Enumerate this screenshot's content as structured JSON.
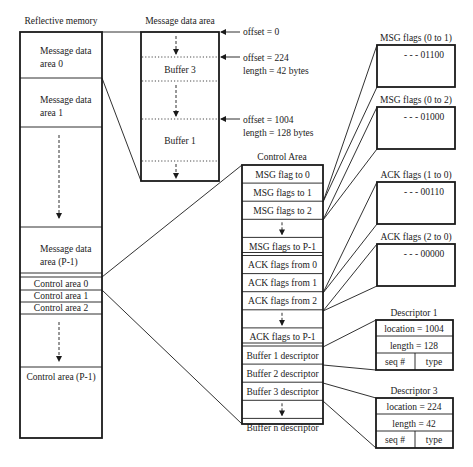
{
  "reflective_memory": {
    "title": "Reflective memory",
    "areas": [
      {
        "line1": "Message data",
        "line2": "area 0"
      },
      {
        "line1": "Message data",
        "line2": "area 1"
      },
      {
        "line1": "Message data",
        "line2": "area (P-1)"
      }
    ],
    "control_areas": [
      "Control area 0",
      "Control area 1",
      "Control area 2",
      "Control area (P-1)"
    ]
  },
  "message_data_area": {
    "title": "Message data area",
    "buffers": [
      "Buffer 3",
      "Buffer 1"
    ],
    "annotations": [
      {
        "line1": "offset = 0",
        "line2": ""
      },
      {
        "line1": "offset = 224",
        "line2": "length = 42 bytes"
      },
      {
        "line1": "offset = 1004",
        "line2": "length = 128 bytes"
      }
    ]
  },
  "control_area": {
    "title": "Control Area",
    "rows": [
      "MSG flag to 0",
      "MSG flags to 1",
      "MSG flags to 2",
      "",
      "MSG flags to P-1",
      "ACK flags from 0",
      "ACK flags from 1",
      "ACK flags from 2",
      "",
      "ACK flags to P-1",
      "Buffer 1 descriptor",
      "Buffer 2 descriptor",
      "Buffer 3 descriptor",
      "",
      "Buffer n descriptor"
    ]
  },
  "flag_boxes": [
    {
      "title": "MSG flags (0 to 1)",
      "value": "- - - 01100"
    },
    {
      "title": "MSG flags (0 to 2)",
      "value": "- - - 01000"
    },
    {
      "title": "ACK flags (1 to 0)",
      "value": "- - - 00110"
    },
    {
      "title": "ACK flags (2 to 0)",
      "value": "- - - 00000"
    }
  ],
  "descriptors": [
    {
      "title": "Descriptor 1",
      "location": "location = 1004",
      "length": "length = 128",
      "seq": "seq #",
      "type": "type"
    },
    {
      "title": "Descriptor 3",
      "location": "location = 224",
      "length": "length = 42",
      "seq": "seq #",
      "type": "type"
    }
  ]
}
